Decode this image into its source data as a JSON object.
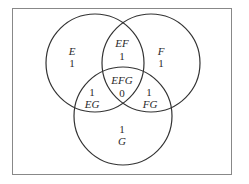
{
  "diagram": {
    "type": "venn",
    "sets": [
      "E",
      "F",
      "G"
    ],
    "regions": [
      {
        "id": "E",
        "label": "E",
        "value": "1"
      },
      {
        "id": "F",
        "label": "F",
        "value": "1"
      },
      {
        "id": "G",
        "label": "G",
        "value": "1"
      },
      {
        "id": "EF",
        "label": "EF",
        "value": "1"
      },
      {
        "id": "EG",
        "label": "EG",
        "value": "1"
      },
      {
        "id": "FG",
        "label": "FG",
        "value": "1"
      },
      {
        "id": "EFG",
        "label": "EFG",
        "value": "0"
      }
    ],
    "colors": {
      "stroke": "#333333",
      "frame": "#888888",
      "text": "#2a2a2a"
    }
  }
}
